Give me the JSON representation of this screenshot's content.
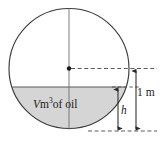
{
  "figure": {
    "shape": "circle",
    "colors": {
      "stroke": "#3a3a3a",
      "fill_shaded": "#d5d5d5",
      "background": "#ffffff",
      "text": "#1a1a1a"
    },
    "labels": {
      "volume_prefix": "V",
      "volume_units": "m",
      "volume_exponent": "3",
      "volume_suffix": "of oil",
      "depth": "h",
      "radius_measure": "1 m"
    },
    "geometry": {
      "circle_center_x": 69,
      "circle_center_y": 68.5,
      "circle_radius": 60,
      "oil_surface_y": 87,
      "tank_bottom_y": 130.5,
      "inner_arrow_x": 118,
      "outer_arrow_x": 136,
      "dashed_extent_x": 157
    }
  }
}
